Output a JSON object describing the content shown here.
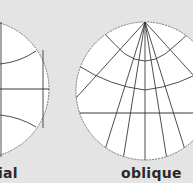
{
  "diagram": {
    "panels": [
      {
        "id": "equatorial",
        "label": "ial",
        "label_full_partially_cropped": true,
        "circle": {
          "cx": -20,
          "cy": 89,
          "r": 69
        },
        "equator_y": 89,
        "meridian_x": 43
      },
      {
        "id": "oblique",
        "label": "oblique",
        "circle": {
          "cx": 145,
          "cy": 91,
          "r": 69
        },
        "pole": {
          "x": 145,
          "y": 22
        },
        "horizontal_y": 113,
        "central_meridian_x": 145
      }
    ]
  },
  "colors": {
    "background": "#e4e4e4",
    "disc_fill": "#ffffff",
    "outline": "#777777",
    "graticule": "#3a3a3a",
    "label": "#2a2a2a"
  }
}
